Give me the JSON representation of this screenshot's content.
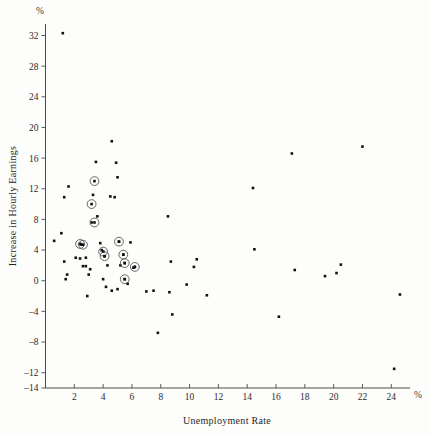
{
  "chart_data": {
    "type": "scatter",
    "title": "",
    "xlabel": "Unemployment Rate",
    "ylabel": "Increase in Hourly Earnings",
    "x_unit": "%",
    "y_unit": "%",
    "xlim": [
      0,
      25.3
    ],
    "ylim": [
      -14,
      33.5
    ],
    "xticks": [
      2,
      4,
      6,
      8,
      10,
      12,
      14,
      16,
      18,
      20,
      22,
      24
    ],
    "yticks": [
      -14,
      -12,
      -8,
      -4,
      0,
      4,
      8,
      12,
      16,
      20,
      24,
      28,
      32
    ],
    "grid": false,
    "legend": "none",
    "series": [
      {
        "name": "observations",
        "marker": "filled-square",
        "points": [
          [
            1.2,
            32.3
          ],
          [
            1.6,
            12.3
          ],
          [
            1.3,
            10.9
          ],
          [
            0.6,
            5.2
          ],
          [
            1.1,
            6.2
          ],
          [
            1.3,
            2.5
          ],
          [
            1.4,
            0.2
          ],
          [
            1.5,
            0.8
          ],
          [
            2.4,
            4.8
          ],
          [
            2.5,
            4.7
          ],
          [
            2.1,
            3.0
          ],
          [
            2.4,
            2.9
          ],
          [
            2.8,
            3.0
          ],
          [
            2.6,
            1.9
          ],
          [
            2.8,
            1.9
          ],
          [
            3.0,
            0.8
          ],
          [
            3.1,
            1.5
          ],
          [
            2.9,
            -2.0
          ],
          [
            3.3,
            11.2
          ],
          [
            3.5,
            15.5
          ],
          [
            3.2,
            7.6
          ],
          [
            3.6,
            8.4
          ],
          [
            3.8,
            4.9
          ],
          [
            3.9,
            4.0
          ],
          [
            4.0,
            3.8
          ],
          [
            4.1,
            3.2
          ],
          [
            4.3,
            2.0
          ],
          [
            4.0,
            0.2
          ],
          [
            4.2,
            -0.8
          ],
          [
            4.5,
            11.0
          ],
          [
            4.6,
            18.2
          ],
          [
            4.9,
            15.4
          ],
          [
            5.0,
            13.5
          ],
          [
            4.8,
            10.9
          ],
          [
            5.1,
            5.1
          ],
          [
            5.4,
            3.4
          ],
          [
            5.5,
            2.3
          ],
          [
            5.2,
            2.0
          ],
          [
            5.5,
            0.2
          ],
          [
            5.7,
            -0.4
          ],
          [
            5.9,
            5.0
          ],
          [
            6.2,
            1.8
          ],
          [
            6.1,
            1.7
          ],
          [
            4.6,
            -1.3
          ],
          [
            5.0,
            -1.1
          ],
          [
            7.0,
            -1.4
          ],
          [
            7.5,
            -1.3
          ],
          [
            7.8,
            -6.8
          ],
          [
            8.5,
            8.4
          ],
          [
            8.7,
            2.5
          ],
          [
            8.6,
            -1.5
          ],
          [
            8.8,
            -4.4
          ],
          [
            9.8,
            -0.5
          ],
          [
            10.3,
            1.8
          ],
          [
            10.5,
            2.8
          ],
          [
            11.2,
            -1.9
          ],
          [
            14.4,
            12.1
          ],
          [
            14.5,
            4.1
          ],
          [
            16.2,
            -4.7
          ],
          [
            17.1,
            16.6
          ],
          [
            17.3,
            1.4
          ],
          [
            19.4,
            0.6
          ],
          [
            20.2,
            1.0
          ],
          [
            20.5,
            2.1
          ],
          [
            22.0,
            17.5
          ],
          [
            24.2,
            -11.5
          ],
          [
            24.6,
            -1.8
          ]
        ]
      }
    ],
    "highlighted_points": [
      [
        3.4,
        13.0
      ],
      [
        3.2,
        10.0
      ],
      [
        3.4,
        7.6
      ],
      [
        2.4,
        4.8
      ],
      [
        2.6,
        4.7
      ],
      [
        5.1,
        5.1
      ],
      [
        4.0,
        3.8
      ],
      [
        4.1,
        3.2
      ],
      [
        5.4,
        3.4
      ],
      [
        5.5,
        2.3
      ],
      [
        6.2,
        1.8
      ],
      [
        5.5,
        0.2
      ]
    ]
  }
}
